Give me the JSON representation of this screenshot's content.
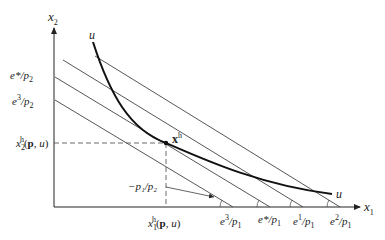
{
  "diagram": {
    "type": "hicksian-demand-expenditure-minimization",
    "axes": {
      "x": {
        "label": "x",
        "sub": "1"
      },
      "y": {
        "label": "x",
        "sub": "2"
      }
    },
    "curve": {
      "label_top": "u",
      "label_bottom": "u"
    },
    "point": {
      "label": "x",
      "sup": "h"
    },
    "y_intercepts": [
      {
        "num": "e*",
        "den": "p",
        "den_sub": "2"
      },
      {
        "num": "e",
        "num_sup": "3",
        "den": "p",
        "den_sub": "2"
      }
    ],
    "x_intercepts": [
      {
        "num": "e",
        "num_sup": "3",
        "den": "p",
        "den_sub": "1"
      },
      {
        "num": "e*",
        "den": "p",
        "den_sub": "1"
      },
      {
        "num": "e",
        "num_sup": "1",
        "den": "p",
        "den_sub": "1"
      },
      {
        "num": "e",
        "num_sup": "2",
        "den": "p",
        "den_sub": "1"
      }
    ],
    "x_demand": {
      "var": "x",
      "sub": "1",
      "sup": "h",
      "args": "(p, u)"
    },
    "y_demand": {
      "var": "x",
      "sub": "2",
      "sup": "h",
      "args": "(p, u)"
    },
    "slope_label": "−p₁/p₂",
    "colors": {
      "line": "#333333",
      "curve": "#111111",
      "dashed": "#444444"
    }
  }
}
